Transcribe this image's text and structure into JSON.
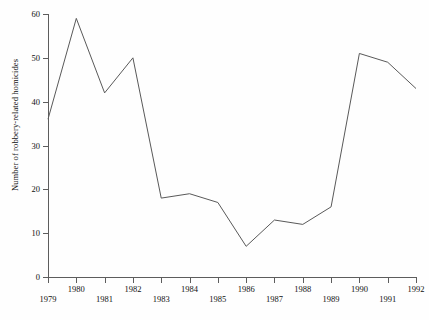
{
  "chart_data": {
    "type": "line",
    "title": "",
    "xlabel": "",
    "ylabel": "Number of robbery-related homicides",
    "categories": [
      "1979",
      "1980",
      "1981",
      "1982",
      "1983",
      "1984",
      "1985",
      "1986",
      "1987",
      "1988",
      "1989",
      "1990",
      "1991",
      "1992"
    ],
    "values": [
      36,
      59,
      42,
      50,
      18,
      19,
      17,
      7,
      13,
      12,
      16,
      51,
      49,
      43
    ],
    "series": [
      {
        "name": "Robbery-related homicides",
        "values": [
          36,
          59,
          42,
          50,
          18,
          19,
          17,
          7,
          13,
          12,
          16,
          51,
          49,
          43
        ]
      }
    ],
    "ylim": [
      0,
      60
    ],
    "yticks": [
      0,
      10,
      20,
      30,
      40,
      50,
      60
    ],
    "ytick_labels": [
      "0",
      "10",
      "20",
      "30",
      "40",
      "50",
      "60"
    ],
    "xlim": [
      "1979",
      "1992"
    ],
    "xticks": [
      "1979",
      "1980",
      "1981",
      "1982",
      "1983",
      "1984",
      "1985",
      "1986",
      "1987",
      "1988",
      "1989",
      "1990",
      "1991",
      "1992"
    ],
    "xtick_label_rows": [
      "low",
      "high",
      "low",
      "high",
      "low",
      "high",
      "low",
      "high",
      "low",
      "high",
      "low",
      "high",
      "low",
      "high"
    ],
    "grid": false,
    "legend": null,
    "legend_position": "none",
    "line_color": "#595959",
    "line_width": 1,
    "axis_color": "#5d5d5d",
    "background_color": "#fefefe",
    "text_color": "#111111",
    "markers": false
  }
}
